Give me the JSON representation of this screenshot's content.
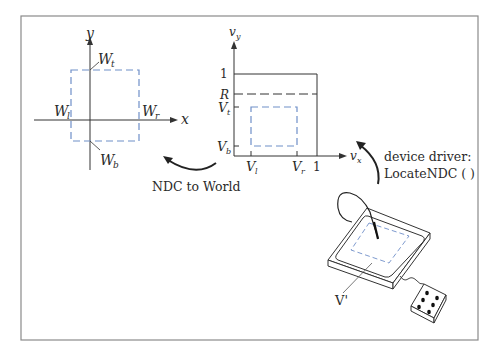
{
  "world_axes": {
    "x_label": "x",
    "y_label": "y",
    "window_labels": {
      "top": "W",
      "top_sub": "t",
      "bottom": "W",
      "bottom_sub": "b",
      "left": "W",
      "left_sub": "l",
      "right": "W",
      "right_sub": "r"
    }
  },
  "ndc_axes": {
    "x_label": "v",
    "x_sub": "x",
    "y_label": "v",
    "y_sub": "y",
    "y_ticks": {
      "one": "1",
      "R": "R",
      "Vt": "V",
      "Vt_sub": "t",
      "Vb": "V",
      "Vb_sub": "b"
    },
    "x_ticks": {
      "Vl": "V",
      "Vl_sub": "l",
      "Vr": "V",
      "Vr_sub": "r",
      "one": "1"
    }
  },
  "arrows": {
    "ndc_to_world": "NDC to World",
    "device_driver_line1": "device driver:",
    "device_driver_line2": "LocateNDC ( )"
  },
  "device": {
    "viewport_label": "V'"
  },
  "colors": {
    "line": "#333333",
    "dashed_blue": "#6f8fc8",
    "border": "#8a8a8a"
  }
}
